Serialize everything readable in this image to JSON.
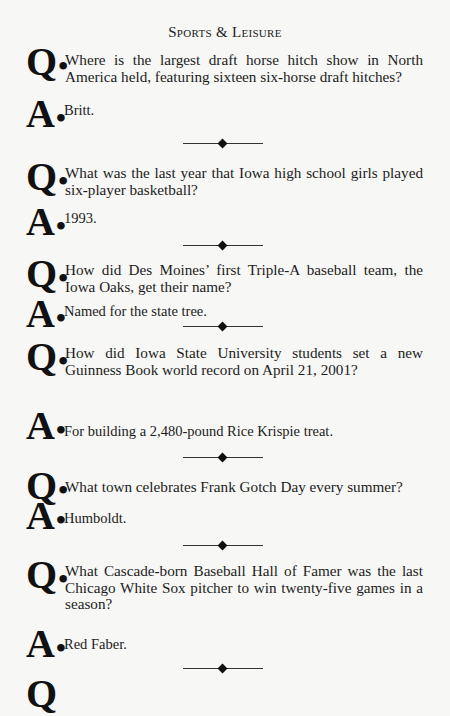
{
  "header": {
    "title": "Sports & Leisure"
  },
  "qa_items": [
    {
      "q_marker": "Q",
      "question": "Where is the largest draft horse hitch show in North America held, featuring sixteen six-horse draft hitches?",
      "a_marker": "A",
      "answer": "Britt."
    },
    {
      "q_marker": "Q",
      "question": "What was the last year that Iowa high school girls played six-player basketball?",
      "a_marker": "A",
      "answer": "1993."
    },
    {
      "q_marker": "Q",
      "question": "How did Des Moines’ first Triple-A baseball team, the Iowa Oaks, get their name?",
      "a_marker": "A",
      "answer": "Named for the state tree."
    },
    {
      "q_marker": "Q",
      "question": "How did Iowa State University students set a new Guinness Book world record on April 21, 2001?",
      "a_marker": "A",
      "answer": "For building a 2,480-pound Rice Krispie treat."
    },
    {
      "q_marker": "Q",
      "question": "What town celebrates Frank Gotch Day every summer?",
      "a_marker": "A",
      "answer": "Humboldt."
    },
    {
      "q_marker": "Q",
      "question": "What Cascade-born Baseball Hall of Famer was the last Chicago White Sox pitcher to win twenty-five games in a season?",
      "a_marker": "A",
      "answer": "Red Faber."
    }
  ],
  "partial_next": {
    "q_marker": "Q"
  },
  "separator": {
    "icon": "diamond-rule-icon"
  }
}
